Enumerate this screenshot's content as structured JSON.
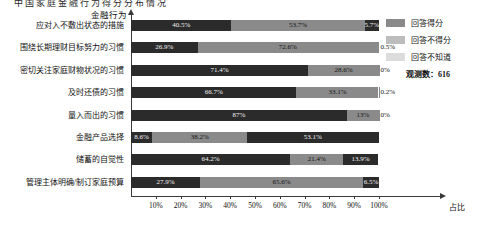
{
  "top_caption": "中国家庭金融行为得分分布情况",
  "chart_data": {
    "type": "bar",
    "orientation": "horizontal",
    "stacked": true,
    "title": "",
    "xlabel": "占比",
    "ylabel": "金融行为",
    "xlim": [
      0,
      100
    ],
    "grid": false,
    "legend_position": "right",
    "observations_label": "观测数：616",
    "tick_labels": [
      "10%",
      "20%",
      "30%",
      "40%",
      "50%",
      "60%",
      "70%",
      "80%",
      "90%",
      "100%"
    ],
    "tick_values": [
      10,
      20,
      30,
      40,
      50,
      60,
      70,
      80,
      90,
      100
    ],
    "categories": [
      "应对入不敷出状态的措施",
      "围绕长期理财目标努力的习惯",
      "密切关注家庭财物状况的习惯",
      "及时还债的习惯",
      "量入而出的习惯",
      "金融产品选择",
      "储蓄的自觉性",
      "管理主体明确/制订家庭预算"
    ],
    "series": [
      {
        "name": "回答得分",
        "color": "#8a8a8a",
        "values": [
          53.7,
          72.6,
          28.6,
          33.1,
          13.0,
          38.2,
          21.4,
          65.6
        ]
      },
      {
        "name": "回答不得分",
        "color": "#bdbdbd",
        "values": [
          40.5,
          26.9,
          71.4,
          66.7,
          87.0,
          53.1,
          64.2,
          27.9
        ]
      },
      {
        "name": "回答不知道",
        "color": "#dcdcdc",
        "values": [
          5.7,
          0.5,
          0.0,
          0.2,
          0.0,
          8.6,
          13.9,
          6.5
        ]
      }
    ],
    "bars": [
      {
        "category": "应对入不敷出状态的措施",
        "segments": [
          {
            "series": "回答不得分",
            "value": 40.5,
            "label": "40.5%",
            "shade": "s0"
          },
          {
            "series": "回答得分",
            "value": 53.7,
            "label": "53.7%",
            "shade": "s1"
          },
          {
            "series": "回答不知道",
            "value": 5.7,
            "label": "5.7%",
            "shade": "s0"
          }
        ]
      },
      {
        "category": "围绕长期理财目标努力的习惯",
        "segments": [
          {
            "series": "回答不得分",
            "value": 26.9,
            "label": "26.9%",
            "shade": "s0"
          },
          {
            "series": "回答得分",
            "value": 72.6,
            "label": "72.6%",
            "shade": "s1"
          },
          {
            "series": "回答不知道",
            "value": 0.5,
            "label": "0.5%",
            "shade": "s1"
          }
        ]
      },
      {
        "category": "密切关注家庭财物状况的习惯",
        "segments": [
          {
            "series": "回答不得分",
            "value": 71.4,
            "label": "71.4%",
            "shade": "s0"
          },
          {
            "series": "回答得分",
            "value": 28.6,
            "label": "28.6%",
            "shade": "s1"
          },
          {
            "series": "回答不知道",
            "value": 0.0,
            "label": "0%",
            "shade": "s1"
          }
        ]
      },
      {
        "category": "及时还债的习惯",
        "segments": [
          {
            "series": "回答不得分",
            "value": 66.7,
            "label": "66.7%",
            "shade": "s0"
          },
          {
            "series": "回答得分",
            "value": 33.1,
            "label": "33.1%",
            "shade": "s1"
          },
          {
            "series": "回答不知道",
            "value": 0.2,
            "label": "0.2%",
            "shade": "s1"
          }
        ]
      },
      {
        "category": "量入而出的习惯",
        "segments": [
          {
            "series": "回答不得分",
            "value": 87.0,
            "label": "87%",
            "shade": "s0"
          },
          {
            "series": "回答得分",
            "value": 13.0,
            "label": "13%",
            "shade": "s1"
          },
          {
            "series": "回答不知道",
            "value": 0.0,
            "label": "0%",
            "shade": "s1"
          }
        ]
      },
      {
        "category": "金融产品选择",
        "segments": [
          {
            "series": "回答不知道",
            "value": 8.6,
            "label": "8.6%",
            "shade": "s0"
          },
          {
            "series": "回答得分",
            "value": 38.2,
            "label": "38.2%",
            "shade": "s1"
          },
          {
            "series": "回答不得分",
            "value": 53.1,
            "label": "53.1%",
            "shade": "s0"
          }
        ]
      },
      {
        "category": "储蓄的自觉性",
        "segments": [
          {
            "series": "回答不得分",
            "value": 64.2,
            "label": "64.2%",
            "shade": "s0"
          },
          {
            "series": "回答得分",
            "value": 21.4,
            "label": "21.4%",
            "shade": "s1"
          },
          {
            "series": "回答不知道",
            "value": 13.9,
            "label": "13.9%",
            "shade": "s0"
          }
        ]
      },
      {
        "category": "管理主体明确/制订家庭预算",
        "segments": [
          {
            "series": "回答不得分",
            "value": 27.9,
            "label": "27.9%",
            "shade": "s0"
          },
          {
            "series": "回答得分",
            "value": 65.6,
            "label": "65.6%",
            "shade": "s1"
          },
          {
            "series": "回答不知道",
            "value": 6.5,
            "label": "6.5%",
            "shade": "s0"
          }
        ]
      }
    ]
  },
  "legend": {
    "items": [
      {
        "label": "回答得分"
      },
      {
        "label": "回答不得分"
      },
      {
        "label": "回答不知道"
      }
    ],
    "note": "观测数：616"
  }
}
